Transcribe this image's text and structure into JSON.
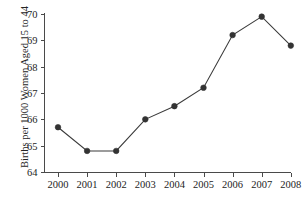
{
  "chart_data": {
    "type": "line",
    "title": "",
    "xlabel": "",
    "ylabel": "Births per 1000 Women Aged 15 to 44",
    "categories": [
      "2000",
      "2001",
      "2002",
      "2003",
      "2004",
      "2005",
      "2006",
      "2007",
      "2008"
    ],
    "x": [
      2000,
      2001,
      2002,
      2003,
      2004,
      2005,
      2006,
      2007,
      2008
    ],
    "values": [
      65.7,
      64.8,
      64.8,
      66.0,
      66.5,
      67.2,
      69.2,
      69.9,
      68.8
    ],
    "series": [
      {
        "name": "Birth rate",
        "values": [
          65.7,
          64.8,
          64.8,
          66.0,
          66.5,
          67.2,
          69.2,
          69.9,
          68.8
        ]
      }
    ],
    "ylim": [
      64,
      70
    ],
    "yticks": [
      64,
      65,
      66,
      67,
      68,
      69,
      70
    ],
    "ytick_labels": [
      "64",
      "65",
      "66",
      "67",
      "68",
      "69",
      "70"
    ],
    "xtick_labels": [
      "2000",
      "2001",
      "2002",
      "2003",
      "2004",
      "2005",
      "2006",
      "2007",
      "2008"
    ],
    "grid": false,
    "legend": false,
    "legend_position": "none",
    "line_color": "#3a3a3a",
    "marker_color": "#333333",
    "axis_color": "#4a4a4a",
    "background_color": "#ffffff",
    "marker": "filled-circle"
  },
  "figure": {
    "title_sliver": "",
    "ylabel": "Births per 1000 Women Aged 15 to 44"
  }
}
